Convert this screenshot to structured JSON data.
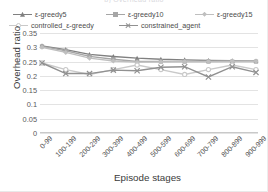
{
  "chart_data": {
    "type": "line",
    "title": "b) Overhead ratio",
    "xlabel": "Episode stages",
    "ylabel": "Overhead ratio",
    "categories": [
      "0-99",
      "100-199",
      "200-299",
      "300-399",
      "400-499",
      "500-599",
      "600-699",
      "700-799",
      "800-899",
      "900-999"
    ],
    "yticks": [
      "0",
      "0.05",
      "0.1",
      "0.15",
      "0.2",
      "0.25",
      "0.3",
      "0.35"
    ],
    "ylim": [
      0,
      0.35
    ],
    "grid": true,
    "legend_position": "top",
    "series": [
      {
        "name": "ε-greedy5",
        "color": "#808080",
        "marker": "triangle",
        "values": [
          0.305,
          0.292,
          0.275,
          0.268,
          0.262,
          0.258,
          0.256,
          0.254,
          0.253,
          0.252
        ]
      },
      {
        "name": "ε-greedy10",
        "color": "#a6a6a6",
        "marker": "square",
        "values": [
          0.303,
          0.288,
          0.268,
          0.258,
          0.25,
          0.25,
          0.25,
          0.25,
          0.25,
          0.25
        ]
      },
      {
        "name": "ε-greedy15",
        "color": "#bfbfbf",
        "marker": "diamond",
        "values": [
          0.3,
          0.282,
          0.262,
          0.252,
          0.248,
          0.249,
          0.25,
          0.25,
          0.251,
          0.251
        ]
      },
      {
        "name": "controlled_ε-greedy",
        "color": "#c9c9c9",
        "marker": "circle",
        "values": [
          0.245,
          0.222,
          0.205,
          0.222,
          0.238,
          0.222,
          0.205,
          0.222,
          0.238,
          0.222
        ]
      },
      {
        "name": "constrained_agent",
        "color": "#919191",
        "marker": "x",
        "values": [
          0.245,
          0.208,
          0.208,
          0.22,
          0.218,
          0.23,
          0.232,
          0.196,
          0.232,
          0.212
        ]
      }
    ]
  }
}
